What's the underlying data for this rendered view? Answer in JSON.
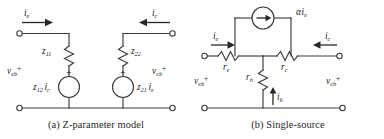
{
  "figure": {
    "panels": [
      {
        "id": "z-parameter-model",
        "caption": "(a) Z-parameter model",
        "currents": [
          {
            "name": "i-e",
            "symbol": "i",
            "subscript": "e",
            "direction": "right"
          },
          {
            "name": "i-c",
            "symbol": "i",
            "subscript": "c",
            "direction": "left"
          }
        ],
        "impedances": [
          {
            "name": "z11",
            "symbol": "z",
            "subscript": "11",
            "orientation": "vertical"
          },
          {
            "name": "z22",
            "symbol": "z",
            "subscript": "22",
            "orientation": "vertical"
          }
        ],
        "sources": [
          {
            "name": "z12-ic-source",
            "symbol": "z",
            "subscript": "12",
            "factor_symbol": "i",
            "factor_subscript": "c",
            "polarity": "+",
            "type": "voltage"
          },
          {
            "name": "z21-ie-source",
            "symbol": "z",
            "subscript": "21",
            "factor_symbol": "i",
            "factor_subscript": "e",
            "polarity": "+",
            "type": "voltage"
          }
        ],
        "port_voltages": [
          {
            "name": "v-eb",
            "symbol": "v",
            "subscript": "eb",
            "polarity": "+"
          },
          {
            "name": "v-cb",
            "symbol": "v",
            "subscript": "cb",
            "polarity": "+"
          }
        ]
      },
      {
        "id": "single-source",
        "caption": "(b) Single-source",
        "currents": [
          {
            "name": "i-e",
            "symbol": "i",
            "subscript": "e",
            "direction": "right"
          },
          {
            "name": "i-c",
            "symbol": "i",
            "subscript": "c",
            "direction": "left"
          },
          {
            "name": "i-b",
            "symbol": "i",
            "subscript": "b",
            "direction": "up"
          }
        ],
        "resistors": [
          {
            "name": "r-e",
            "symbol": "r",
            "subscript": "e",
            "orientation": "horizontal"
          },
          {
            "name": "r-c",
            "symbol": "r",
            "subscript": "c",
            "orientation": "horizontal"
          },
          {
            "name": "r-b",
            "symbol": "r",
            "subscript": "b",
            "orientation": "vertical"
          }
        ],
        "sources": [
          {
            "name": "alpha-ie-source",
            "symbol": "α",
            "factor_symbol": "i",
            "factor_subscript": "e",
            "type": "current",
            "arrow_direction": "right"
          }
        ],
        "port_voltages": [
          {
            "name": "v-eb",
            "symbol": "v",
            "subscript": "eb",
            "polarity": "+"
          },
          {
            "name": "v-cb",
            "symbol": "v",
            "subscript": "cb",
            "polarity": "+"
          }
        ]
      }
    ],
    "colors": {
      "wire": "#3a3a3a",
      "text": "#1c1c1c",
      "background": "#ffffff"
    }
  }
}
